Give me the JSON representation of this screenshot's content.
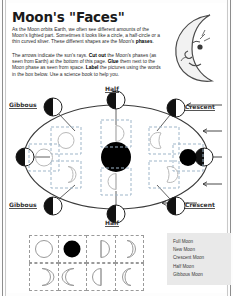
{
  "page": {
    "title": "Moon's \"Faces\"",
    "paragraph1_parts": [
      {
        "t": "As the Moon orbits Earth, we often see different amounts of the Moon's lighted part.  Sometimes it looks like a circle, a half-circle or a thin curved sliver.  These different shapes are the Moon's ",
        "b": false
      },
      {
        "t": "phases",
        "b": true
      },
      {
        "t": ".",
        "b": false
      }
    ],
    "paragraph2_parts": [
      {
        "t": "The arrows indicate the sun's rays. ",
        "b": false
      },
      {
        "t": "Cut out",
        "b": true
      },
      {
        "t": " the Moon's phases (as seen from Earth) at the bottom of this page. ",
        "b": false
      },
      {
        "t": "Glue",
        "b": true
      },
      {
        "t": " them next to the Moon phase as seen from space. ",
        "b": false
      },
      {
        "t": "Label",
        "b": true
      },
      {
        "t": " the pictures using the words in the box below. Use a science book to help you.",
        "b": false
      }
    ]
  },
  "illustration": {
    "name": "crescent-moon-with-face",
    "description": "smiling crescent moon character with closed eye, nose and mouth"
  },
  "diagram": {
    "earth": {
      "name": "earth",
      "fill": "#000000"
    },
    "orbit": {
      "shape": "ellipse",
      "stroke": "#333333"
    },
    "sun_rays": {
      "direction": "left",
      "count": 4,
      "label": "arrows indicate the sun's rays"
    },
    "labels": [
      {
        "text": "Half",
        "position": "top-center"
      },
      {
        "text": "Gibbous",
        "position": "top-left"
      },
      {
        "text": "Crescent",
        "position": "top-right"
      },
      {
        "text": "Gibbous",
        "position": "bottom-left"
      },
      {
        "text": "Crescent",
        "position": "bottom-right"
      },
      {
        "text": "Half",
        "position": "bottom-center"
      }
    ],
    "orbit_moons": [
      {
        "position": "top-left",
        "lit_side": "right"
      },
      {
        "position": "top-center",
        "lit_side": "right"
      },
      {
        "position": "top-right",
        "lit_side": "right"
      },
      {
        "position": "right",
        "lit_side": "right"
      },
      {
        "position": "bottom-right",
        "lit_side": "right"
      },
      {
        "position": "bottom-center",
        "lit_side": "right"
      },
      {
        "position": "bottom-left",
        "lit_side": "right"
      },
      {
        "position": "left",
        "lit_side": "right"
      }
    ],
    "glue_boxes": [
      {
        "slot": "upper-left",
        "phase": "full"
      },
      {
        "slot": "upper-mid-left",
        "phase": "half-right"
      },
      {
        "slot": "upper-mid-right",
        "phase": "crescent-right"
      },
      {
        "slot": "left",
        "phase": "full"
      },
      {
        "slot": "right",
        "phase": "new"
      },
      {
        "slot": "lower-left",
        "phase": "gibbous-left"
      },
      {
        "slot": "lower-mid-left",
        "phase": "half-left"
      },
      {
        "slot": "lower-mid-right",
        "phase": "crescent-left"
      }
    ]
  },
  "cutouts": {
    "row1": [
      {
        "phase": "full-outline"
      },
      {
        "phase": "new-solid"
      },
      {
        "phase": "half-right"
      },
      {
        "phase": "gibbous-right"
      }
    ],
    "row2": [
      {
        "phase": "crescent-right"
      },
      {
        "phase": "crescent-left"
      },
      {
        "phase": "half-left"
      },
      {
        "phase": "gibbous-left"
      }
    ]
  },
  "wordbox": {
    "items": [
      "Full Moon",
      "New Moon",
      "Crescent Moon",
      "Half Moon",
      "Gibbous Moon"
    ]
  }
}
